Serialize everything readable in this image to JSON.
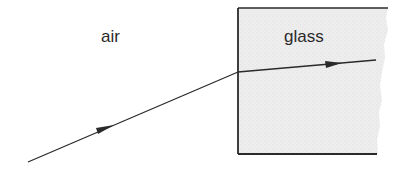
{
  "diagram": {
    "type": "refraction",
    "labels": {
      "air": "air",
      "glass": "glass"
    },
    "colors": {
      "ink": "#2a2a2a",
      "glass_fill": "#ececec",
      "background": "#ffffff"
    },
    "regions": [
      {
        "name": "air",
        "label": "air"
      },
      {
        "name": "glass",
        "label": "glass"
      }
    ],
    "rays": [
      {
        "name": "incident-ray",
        "from": [
          28,
          162
        ],
        "to": [
          238,
          72
        ],
        "arrow": "forward"
      },
      {
        "name": "refracted-ray",
        "from": [
          238,
          72
        ],
        "to": [
          376,
          60
        ],
        "arrow": "forward"
      }
    ]
  }
}
